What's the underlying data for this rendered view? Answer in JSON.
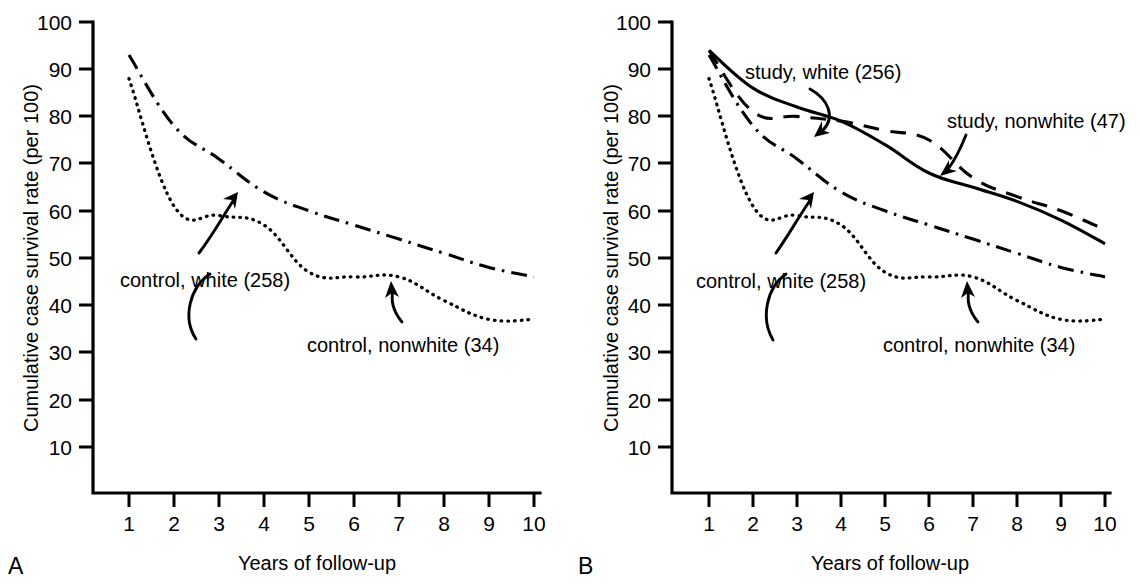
{
  "figure": {
    "panels": [
      {
        "letter": "A",
        "y_axis_title": "Cumulative case survival rate (per 100)",
        "x_axis_title": "Years of follow-up",
        "y_ticks": [
          100,
          90,
          80,
          70,
          60,
          50,
          40,
          30,
          20,
          10
        ],
        "x_ticks": [
          1,
          2,
          3,
          4,
          5,
          6,
          7,
          8,
          9,
          10
        ],
        "annotations": [
          {
            "name": "control-white-label",
            "text": "control, white (258)"
          },
          {
            "name": "control-nonwhite-label",
            "text": "control, nonwhite (34)"
          }
        ]
      },
      {
        "letter": "B",
        "y_axis_title": "Cumulative case survival rate (per 100)",
        "x_axis_title": "Years of follow-up",
        "y_ticks": [
          100,
          90,
          80,
          70,
          60,
          50,
          40,
          30,
          20,
          10
        ],
        "x_ticks": [
          1,
          2,
          3,
          4,
          5,
          6,
          7,
          8,
          9,
          10
        ],
        "annotations": [
          {
            "name": "study-white-label",
            "text": "study, white (256)"
          },
          {
            "name": "study-nonwhite-label",
            "text": "study, nonwhite (47)"
          },
          {
            "name": "control-white-label",
            "text": "control, white (258)"
          },
          {
            "name": "control-nonwhite-label",
            "text": "control, nonwhite (34)"
          }
        ]
      }
    ]
  },
  "chart_data": [
    {
      "panel": "A",
      "type": "line",
      "title": "",
      "xlabel": "Years of follow-up",
      "ylabel": "Cumulative case survival rate (per 100)",
      "xlim": [
        0.6,
        10.2
      ],
      "ylim": [
        0,
        100
      ],
      "grid": false,
      "legend_position": "inline-annotations",
      "x": [
        1,
        2,
        3,
        4,
        5,
        6,
        7,
        8,
        9,
        10
      ],
      "series": [
        {
          "name": "control, nonwhite (34)",
          "style": "dash-dot",
          "color": "#000000",
          "values": [
            93,
            78,
            71,
            64,
            60,
            57,
            54,
            51,
            48,
            46
          ]
        },
        {
          "name": "control, white (258)",
          "style": "dotted",
          "color": "#000000",
          "values": [
            88,
            61,
            59,
            57,
            47,
            46,
            46,
            41,
            37,
            37
          ]
        }
      ]
    },
    {
      "panel": "B",
      "type": "line",
      "title": "",
      "xlabel": "Years of follow-up",
      "ylabel": "Cumulative case survival rate (per 100)",
      "xlim": [
        0.6,
        10.2
      ],
      "ylim": [
        0,
        100
      ],
      "grid": false,
      "legend_position": "inline-annotations",
      "x": [
        1,
        2,
        3,
        4,
        5,
        6,
        7,
        8,
        9,
        10
      ],
      "series": [
        {
          "name": "study, white (256)",
          "style": "solid",
          "color": "#000000",
          "values": [
            94,
            86,
            82,
            79,
            74,
            68,
            65,
            62,
            58,
            53
          ]
        },
        {
          "name": "study, nonwhite (47)",
          "style": "dashed",
          "color": "#000000",
          "values": [
            94,
            81,
            80,
            79,
            77,
            75,
            67,
            63,
            60,
            56
          ]
        },
        {
          "name": "control, nonwhite (34)",
          "style": "dash-dot",
          "color": "#000000",
          "values": [
            93,
            78,
            71,
            64,
            60,
            57,
            54,
            51,
            48,
            46
          ]
        },
        {
          "name": "control, white (258)",
          "style": "dotted",
          "color": "#000000",
          "values": [
            88,
            61,
            59,
            57,
            47,
            46,
            46,
            41,
            37,
            37
          ]
        }
      ]
    }
  ]
}
